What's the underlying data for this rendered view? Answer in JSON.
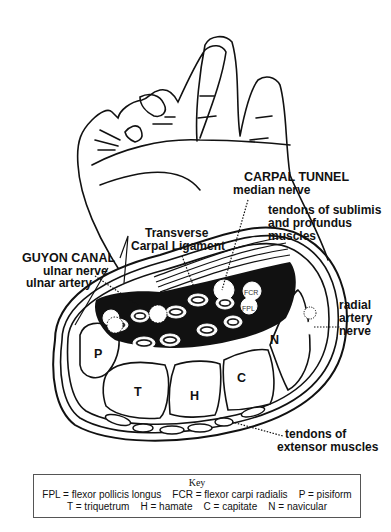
{
  "labels": {
    "carpal_tunnel": "CARPAL TUNNEL",
    "median_nerve": "median nerve",
    "tendons_sublimis_1": "tendons of sublimis",
    "tendons_sublimis_2": "and profundus",
    "tendons_sublimis_3": "muscles",
    "transverse_1": "Transverse",
    "transverse_2": "Carpal Ligament",
    "guyon_canal": "GUYON CANAL",
    "ulnar_nerve": "ulnar nerve",
    "ulnar_artery": "ulnar artery",
    "radial_1": "radial",
    "radial_2": "artery",
    "radial_3": "nerve",
    "extensor_1": "tendons of",
    "extensor_2": "extensor muscles",
    "bones": {
      "P": "P",
      "T": "T",
      "H": "H",
      "C": "C",
      "N": "N"
    },
    "fcr": "FCR",
    "fpl": "FPL"
  },
  "key": {
    "title": "Key",
    "row1": "FPL = flexor pollicis longus    FCR = flexor carpi radialis    P = pisiform",
    "row2": "T = triquetrum    H = hamate    C = capitate    N = navicular"
  }
}
